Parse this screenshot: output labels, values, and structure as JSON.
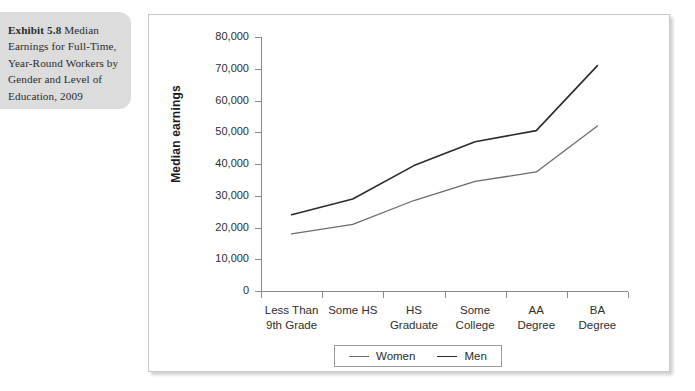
{
  "caption": {
    "lead": "Exhibit 5.8",
    "text": " Median Earnings for Full-Time, Year-Round Workers by Gender and Level of Education, 2009",
    "background_color": "#dcdcdc"
  },
  "chart_data": {
    "type": "line",
    "title": "",
    "xlabel": "",
    "ylabel": "Median earnings",
    "categories": [
      "Less Than\n9th Grade",
      "Some HS",
      "HS\nGraduate",
      "Some\nCollege",
      "AA\nDegree",
      "BA\nDegree"
    ],
    "category_lines": [
      [
        "Less Than",
        "9th Grade"
      ],
      [
        "Some HS",
        ""
      ],
      [
        "HS",
        "Graduate"
      ],
      [
        "Some",
        "College"
      ],
      [
        "AA",
        "Degree"
      ],
      [
        "BA",
        "Degree"
      ]
    ],
    "series": [
      {
        "name": "Women",
        "color": "#6b6b6b",
        "values": [
          18000,
          21000,
          28500,
          34500,
          37500,
          52000
        ]
      },
      {
        "name": "Men",
        "color": "#2b2b2b",
        "values": [
          24000,
          29000,
          39500,
          47000,
          50500,
          71000
        ]
      }
    ],
    "ylim": [
      0,
      80000
    ],
    "ytick_step": 10000,
    "ytick_labels": [
      "80,000",
      "70,000",
      "60,000",
      "50,000",
      "40,000",
      "30,000",
      "20,000",
      "10,000",
      "0"
    ],
    "ytick_values": [
      80000,
      70000,
      60000,
      50000,
      40000,
      30000,
      20000,
      10000,
      0
    ],
    "grid": false,
    "legend_position": "bottom-center"
  },
  "legend": {
    "entries": [
      {
        "label": "Women"
      },
      {
        "label": "Men"
      }
    ]
  }
}
